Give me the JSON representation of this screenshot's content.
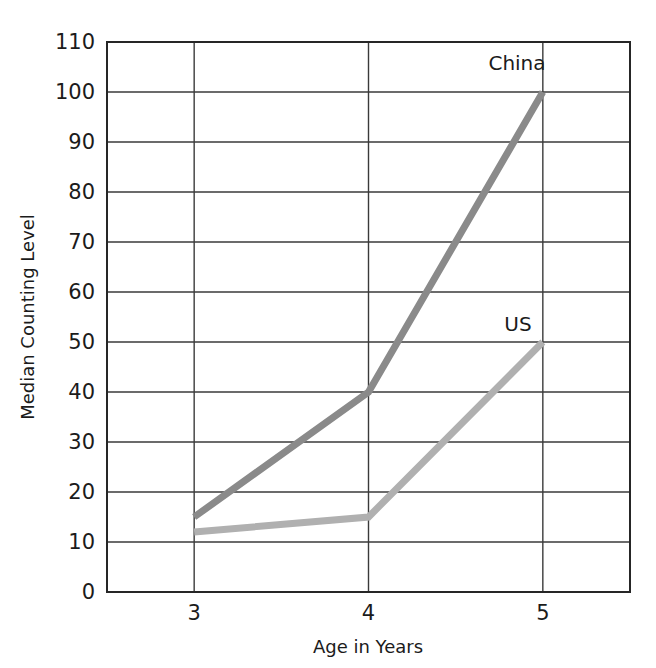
{
  "chart_data": {
    "type": "line",
    "title": "",
    "xlabel": "Age in Years",
    "ylabel": "Median Counting Level",
    "x": [
      3,
      4,
      5
    ],
    "xtick_labels": [
      "3",
      "4",
      "5"
    ],
    "xlim": [
      2.5,
      5.5
    ],
    "ylim": [
      0,
      110
    ],
    "ytick_labels": [
      "0",
      "10",
      "20",
      "30",
      "40",
      "50",
      "60",
      "70",
      "80",
      "90",
      "100",
      "110"
    ],
    "yticks": [
      0,
      10,
      20,
      30,
      40,
      50,
      60,
      70,
      80,
      90,
      100,
      110
    ],
    "grid": true,
    "legend_position": "inline-annotations",
    "series": [
      {
        "name": "China",
        "values": [
          15,
          40,
          100
        ],
        "color": "#8a8a8a",
        "label_text": "China"
      },
      {
        "name": "US",
        "values": [
          12,
          15,
          50
        ],
        "color": "#b0b0b0",
        "label_text": "US"
      }
    ]
  },
  "annotations": {
    "china_label": "China",
    "us_label": "US"
  },
  "axes": {
    "x_title": "Age in Years",
    "y_title": "Median Counting Level"
  },
  "colors": {
    "background": "#ffffff",
    "grid": "#3a3a3a",
    "frame": "#262626",
    "text": "#1b1b1b",
    "china_line": "#8a8a8a",
    "us_line": "#b0b0b0"
  }
}
